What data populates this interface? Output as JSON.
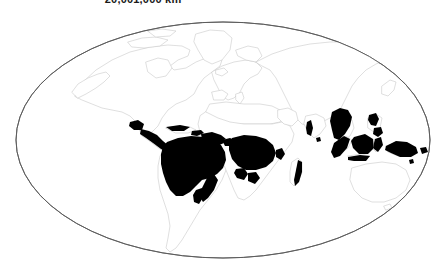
{
  "figure": {
    "title": "20,001,000 km²",
    "background_color": "#ffffff",
    "width": 448,
    "height": 274
  },
  "map": {
    "projection": "mollweide-ellipse",
    "graticule_visible": false,
    "ocean_color": "#ffffff",
    "land_fill_color": "#ffffff",
    "coastline_color": "#c9c9c9",
    "frame_color": "#5a5a5a",
    "highlight_color": "#000000",
    "ellipse": {
      "center_x": 223,
      "center_y": 140,
      "radius_x": 207,
      "radius_y": 118
    },
    "legend_caption": "",
    "highlighted_regions": [
      {
        "name": "Amazon Basin",
        "continent": "South America"
      },
      {
        "name": "Central America",
        "continent": "North America"
      },
      {
        "name": "Caribbean Islands",
        "continent": "North America"
      },
      {
        "name": "Guiana Shield",
        "continent": "South America"
      },
      {
        "name": "Atlantic Forest",
        "continent": "South America"
      },
      {
        "name": "West African Coast",
        "continent": "Africa"
      },
      {
        "name": "Congo Basin",
        "continent": "Africa"
      },
      {
        "name": "East African Coast",
        "continent": "Africa"
      },
      {
        "name": "Eastern Madagascar",
        "continent": "Africa"
      },
      {
        "name": "Western Ghats",
        "continent": "Asia"
      },
      {
        "name": "Indochina",
        "continent": "Asia"
      },
      {
        "name": "Sumatra",
        "continent": "Asia"
      },
      {
        "name": "Borneo",
        "continent": "Asia"
      },
      {
        "name": "Java",
        "continent": "Asia"
      },
      {
        "name": "Sulawesi",
        "continent": "Asia"
      },
      {
        "name": "Philippines",
        "continent": "Asia"
      },
      {
        "name": "New Guinea",
        "continent": "Oceania"
      }
    ],
    "unhighlighted_landmasses": [
      "North America",
      "Greenland",
      "Europe",
      "North Africa",
      "Northern Asia",
      "Australia",
      "New Zealand"
    ]
  }
}
